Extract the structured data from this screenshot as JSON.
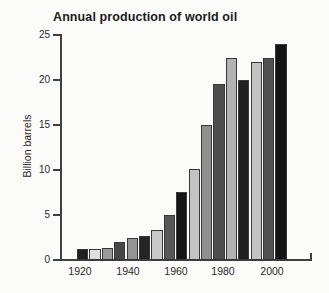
{
  "chart_data": {
    "type": "bar",
    "title": "Annual production of world oil",
    "ylabel": "Billion barrels",
    "xlabel": "",
    "ylim": [
      0,
      25
    ],
    "yticks": [
      0,
      5,
      10,
      15,
      20,
      25
    ],
    "x": [
      1920,
      1925,
      1930,
      1935,
      1940,
      1945,
      1950,
      1955,
      1960,
      1965,
      1970,
      1975,
      1980,
      1985,
      1990,
      1995,
      2000
    ],
    "values": [
      1.2,
      1.2,
      1.3,
      2.0,
      2.5,
      2.7,
      3.3,
      5.0,
      7.6,
      10.1,
      15.0,
      19.6,
      22.5,
      20.0,
      22.0,
      22.5,
      24.0
    ],
    "bar_colors": [
      "#1f1f1f",
      "#dedede",
      "#9a9a9a",
      "#474747",
      "#949494",
      "#242424",
      "#c9c9c9",
      "#585858",
      "#161616",
      "#c3c3c3",
      "#8f8f8f",
      "#4e4e4e",
      "#b2b2b2",
      "#212121",
      "#c3c3c3",
      "#525252",
      "#141414"
    ],
    "xtick_labels": [
      "1920",
      "1940",
      "1960",
      "1980",
      "2000"
    ],
    "grid": false,
    "legend": null
  },
  "colors": {
    "background": "#fbfbf9",
    "axis": "#3f3f3f",
    "text": "#2a2a2a",
    "title_text": "#1c1c1c"
  }
}
